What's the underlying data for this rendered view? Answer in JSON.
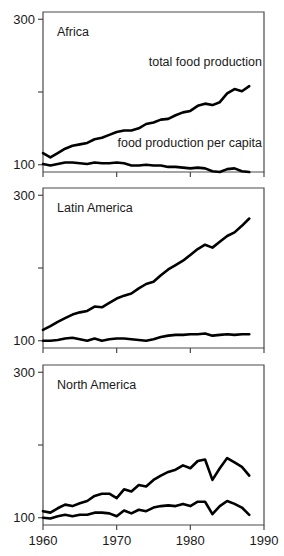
{
  "figure": {
    "width": 284,
    "height": 556,
    "background_color": "#ffffff",
    "line_color": "#000000",
    "axis_color": "#4a4a4a"
  },
  "chart_data": [
    {
      "type": "line",
      "title": "Africa",
      "xlabel": "",
      "ylabel": "",
      "xlim": [
        1960,
        1990
      ],
      "ylim": [
        90,
        310
      ],
      "xticks": [
        1960,
        1970,
        1980,
        1990
      ],
      "xticklabels": [
        "1960",
        "1970",
        "1980",
        "1990"
      ],
      "yticks": [
        100,
        200,
        300
      ],
      "yticklabels": [
        "100",
        "",
        "300"
      ],
      "grid": false,
      "legend_position": "inline-annotation",
      "annotations": [
        {
          "text": "total food production",
          "series": "total food production"
        },
        {
          "text": "food production per capita",
          "series": "food production per capita"
        }
      ],
      "x": [
        1960,
        1961,
        1962,
        1963,
        1964,
        1965,
        1966,
        1967,
        1968,
        1969,
        1970,
        1971,
        1972,
        1973,
        1974,
        1975,
        1976,
        1977,
        1978,
        1979,
        1980,
        1981,
        1982,
        1983,
        1984,
        1985,
        1986,
        1987,
        1988
      ],
      "series": [
        {
          "name": "total food production",
          "values": [
            116,
            110,
            116,
            122,
            126,
            128,
            130,
            135,
            137,
            141,
            145,
            147,
            147,
            150,
            156,
            158,
            162,
            163,
            168,
            172,
            174,
            181,
            184,
            182,
            186,
            198,
            204,
            201,
            208
          ]
        },
        {
          "name": "food production per capita",
          "values": [
            101,
            99,
            101,
            103,
            103,
            102,
            101,
            103,
            102,
            102,
            103,
            102,
            99,
            99,
            100,
            99,
            99,
            97,
            97,
            96,
            95,
            96,
            95,
            91,
            90,
            94,
            95,
            91,
            90
          ]
        }
      ]
    },
    {
      "type": "line",
      "title": "Latin America",
      "xlabel": "",
      "ylabel": "",
      "xlim": [
        1960,
        1990
      ],
      "ylim": [
        90,
        310
      ],
      "xticks": [
        1960,
        1970,
        1980,
        1990
      ],
      "xticklabels": [
        "1960",
        "1970",
        "1980",
        "1990"
      ],
      "yticks": [
        100,
        200,
        300
      ],
      "yticklabels": [
        "100",
        "",
        "300"
      ],
      "grid": false,
      "legend_position": "none",
      "x": [
        1960,
        1961,
        1962,
        1963,
        1964,
        1965,
        1966,
        1967,
        1968,
        1969,
        1970,
        1971,
        1972,
        1973,
        1974,
        1975,
        1976,
        1977,
        1978,
        1979,
        1980,
        1981,
        1982,
        1983,
        1984,
        1985,
        1986,
        1987,
        1988
      ],
      "series": [
        {
          "name": "total food production",
          "values": [
            115,
            120,
            126,
            131,
            136,
            139,
            141,
            147,
            146,
            152,
            158,
            162,
            165,
            172,
            178,
            181,
            190,
            198,
            204,
            210,
            218,
            226,
            232,
            228,
            236,
            244,
            249,
            258,
            268
          ]
        },
        {
          "name": "food production per capita",
          "values": [
            100,
            100,
            101,
            103,
            104,
            102,
            100,
            103,
            100,
            102,
            103,
            103,
            102,
            101,
            100,
            102,
            105,
            107,
            108,
            108,
            109,
            109,
            110,
            107,
            108,
            109,
            108,
            109,
            109
          ]
        }
      ]
    },
    {
      "type": "line",
      "title": "North America",
      "xlabel": "",
      "ylabel": "",
      "xlim": [
        1960,
        1990
      ],
      "ylim": [
        90,
        310
      ],
      "xticks": [
        1960,
        1970,
        1980,
        1990
      ],
      "xticklabels": [
        "1960",
        "1970",
        "1980",
        "1990"
      ],
      "yticks": [
        100,
        200,
        300
      ],
      "yticklabels": [
        "100",
        "",
        "300"
      ],
      "grid": false,
      "legend_position": "none",
      "x": [
        1960,
        1961,
        1962,
        1963,
        1964,
        1965,
        1966,
        1967,
        1968,
        1969,
        1970,
        1971,
        1972,
        1973,
        1974,
        1975,
        1976,
        1977,
        1978,
        1979,
        1980,
        1981,
        1982,
        1983,
        1984,
        1985,
        1986,
        1987,
        1988
      ],
      "series": [
        {
          "name": "total food production",
          "values": [
            109,
            107,
            113,
            118,
            116,
            120,
            123,
            130,
            133,
            133,
            127,
            139,
            136,
            145,
            143,
            152,
            158,
            163,
            166,
            172,
            168,
            178,
            180,
            152,
            168,
            182,
            176,
            170,
            158
          ]
        },
        {
          "name": "food production per capita",
          "values": [
            100,
            99,
            102,
            104,
            102,
            104,
            104,
            107,
            107,
            106,
            102,
            110,
            106,
            111,
            109,
            114,
            116,
            117,
            116,
            119,
            116,
            122,
            122,
            105,
            116,
            123,
            119,
            114,
            104
          ]
        }
      ]
    }
  ]
}
